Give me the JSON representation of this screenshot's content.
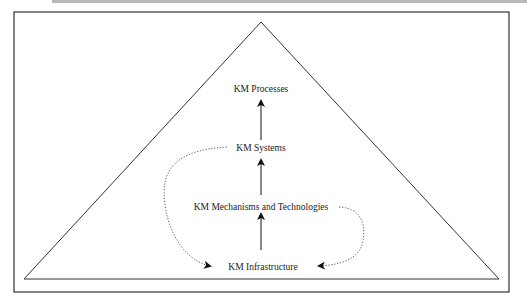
{
  "diagram": {
    "type": "pyramid",
    "nodes": [
      {
        "id": "processes",
        "label": "KM Processes"
      },
      {
        "id": "systems",
        "label": "KM Systems"
      },
      {
        "id": "mechanisms",
        "label": "KM Mechanisms and Technologies"
      },
      {
        "id": "infrastructure",
        "label": "KM Infrastructure"
      }
    ],
    "edges": [
      {
        "from": "infrastructure",
        "to": "mechanisms",
        "style": "solid-arrow"
      },
      {
        "from": "mechanisms",
        "to": "systems",
        "style": "solid-arrow"
      },
      {
        "from": "systems",
        "to": "processes",
        "style": "solid-arrow"
      },
      {
        "from": "systems",
        "to": "infrastructure",
        "style": "dotted-arrow"
      },
      {
        "from": "mechanisms",
        "to": "infrastructure",
        "style": "dotted-arrow"
      }
    ]
  }
}
